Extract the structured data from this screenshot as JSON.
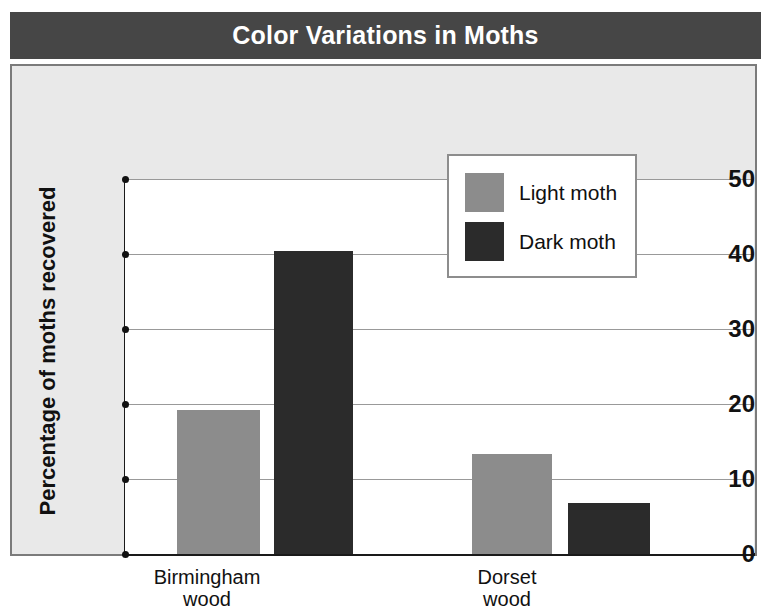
{
  "title": "Color Variations in Moths",
  "legend": {
    "entries": [
      {
        "label": "Light moth",
        "color": "#8c8c8c"
      },
      {
        "label": "Dark moth",
        "color": "#2b2b2b"
      }
    ]
  },
  "axes": {
    "ylabel": "Percentage of moths recovered",
    "yticks": [
      "50",
      "40",
      "30",
      "20",
      "10",
      "0"
    ],
    "xticklabels": [
      {
        "line1": "Birmingham",
        "line2": "wood"
      },
      {
        "line1": "Dorset",
        "line2": "wood"
      }
    ]
  },
  "colors": {
    "title_bar": "#464646",
    "panel": "#e9e9e9",
    "plot_bg": "#ffffff",
    "axis": "#1a1a1a",
    "gridline": "#999999",
    "light_moth": "#8c8c8c",
    "dark_moth": "#2b2b2b"
  },
  "chart_data": {
    "type": "bar",
    "title": "Color Variations in Moths",
    "xlabel": "",
    "ylabel": "Percentage of moths recovered",
    "categories": [
      "Birmingham wood",
      "Dorset wood"
    ],
    "series": [
      {
        "name": "Light moth",
        "color": "#8c8c8c",
        "values": [
          19.2,
          13.4
        ]
      },
      {
        "name": "Dark moth",
        "color": "#2b2b2b",
        "values": [
          40.4,
          6.8
        ]
      }
    ],
    "ylim": [
      0,
      50
    ],
    "ytick_values": [
      0,
      10,
      20,
      30,
      40,
      50
    ],
    "grid": true,
    "legend_position": "upper center"
  },
  "geometry": {
    "bars": [
      {
        "name": "birmingham-light-moth-bar",
        "series": 0,
        "category": 0,
        "left": 52,
        "width": 83,
        "value": 19.2
      },
      {
        "name": "birmingham-dark-moth-bar",
        "series": 1,
        "category": 0,
        "left": 149,
        "width": 79,
        "value": 40.4
      },
      {
        "name": "dorset-light-moth-bar",
        "series": 0,
        "category": 1,
        "left": 347,
        "width": 80,
        "value": 13.4
      },
      {
        "name": "dorset-dark-moth-bar",
        "series": 1,
        "category": 1,
        "left": 443,
        "width": 82,
        "value": 6.8
      }
    ],
    "xlabels": [
      {
        "left": 90,
        "top": 500,
        "width": 210
      },
      {
        "left": 390,
        "top": 500,
        "width": 210
      }
    ]
  }
}
